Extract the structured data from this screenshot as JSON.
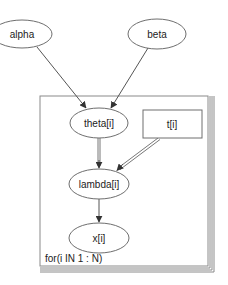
{
  "diagram": {
    "type": "directed-graphical-model",
    "colors": {
      "node_stroke": "#6e6e6e",
      "edge": "#555555",
      "plate": "#8a8a8a",
      "text": "#222222",
      "background": "#ffffff"
    },
    "nodes": [
      {
        "id": "alpha",
        "label": "alpha",
        "shape": "ellipse",
        "kind": "stochastic"
      },
      {
        "id": "beta",
        "label": "beta",
        "shape": "ellipse",
        "kind": "stochastic"
      },
      {
        "id": "theta",
        "label": "theta[i]",
        "shape": "ellipse",
        "kind": "stochastic"
      },
      {
        "id": "t",
        "label": "t[i]",
        "shape": "rectangle",
        "kind": "constant"
      },
      {
        "id": "lambda",
        "label": "lambda[i]",
        "shape": "ellipse",
        "kind": "logical"
      },
      {
        "id": "x",
        "label": "x[i]",
        "shape": "ellipse",
        "kind": "stochastic"
      }
    ],
    "edges": [
      {
        "from": "alpha",
        "to": "theta",
        "style": "single"
      },
      {
        "from": "beta",
        "to": "theta",
        "style": "single"
      },
      {
        "from": "theta",
        "to": "lambda",
        "style": "double"
      },
      {
        "from": "t",
        "to": "lambda",
        "style": "double"
      },
      {
        "from": "lambda",
        "to": "x",
        "style": "single"
      }
    ],
    "plate": {
      "label": "for(i IN 1 : N)",
      "contains": [
        "theta",
        "t",
        "lambda",
        "x"
      ]
    }
  }
}
